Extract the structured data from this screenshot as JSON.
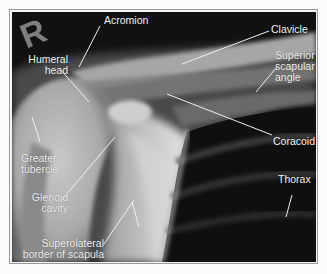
{
  "image": {
    "type": "radiograph",
    "subject": "Right shoulder X-ray (AP view)",
    "side_marker": "R"
  },
  "labels": {
    "acromion": "Acromion",
    "clavicle": "Clavicle",
    "humeral_head_1": "Humeral",
    "humeral_head_2": "head",
    "superior_scapular_angle_1": "Superior",
    "superior_scapular_angle_2": "scapular",
    "superior_scapular_angle_3": "angle",
    "coracoid": "Coracoid",
    "greater_tubercle_1": "Greater",
    "greater_tubercle_2": "tubercle",
    "glenoid_cavity_1": "Glenoid",
    "glenoid_cavity_2": "cavity",
    "thorax": "Thorax",
    "superolateral_border_1": "Superolateral",
    "superolateral_border_2": "border of scapula"
  },
  "colors": {
    "background": "#fbfbfb",
    "frame_border": "#9a9a9a",
    "label_text": "#f4f4f4",
    "leader_line": "#f0f0f0"
  }
}
